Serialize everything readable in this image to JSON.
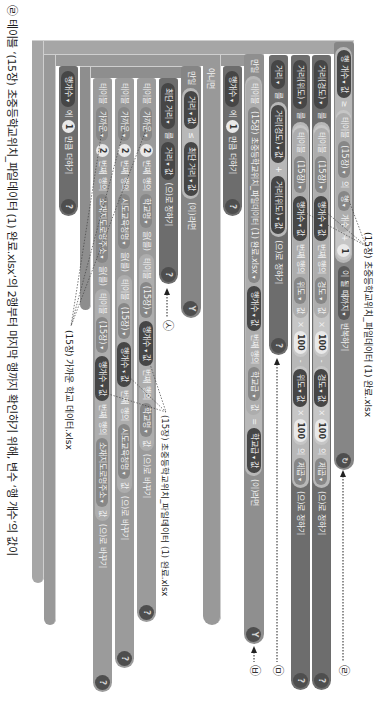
{
  "dropdown_arrow": "▾",
  "icons": {
    "loop": "↻",
    "branch": "Y",
    "help": "?"
  },
  "annotations": {
    "top_file": "(15장) 초중등학교위치_파일데이터 (1) 완료.xlsx",
    "mid_file": "(15장) 초중등학교위치_파일데이터 (1) 완료.xlsx",
    "near_file": "(15장) 가까운 학교 데이터.xlsx",
    "marks": {
      "r": "㉣",
      "m": "㉤",
      "b": "㉥",
      "s": "㉦"
    }
  },
  "blocks": {
    "loop": {
      "var": "행 개수",
      "val": "값",
      "op": "≥",
      "table_label": "테이블",
      "table": "(15장)",
      "of": "의",
      "row": "행",
      "count": "개수",
      "plus": "+",
      "one": "1",
      "until": "이 될 때까지",
      "repeat": "반복하기"
    },
    "set_lon": {
      "var": "거리(경도)",
      "to": "를",
      "table_label": "테이블",
      "table": "(15장)",
      "idx": "행개수",
      "idx_val": "값",
      "nth": "번째 행의",
      "field": "경도",
      "field_val": "값",
      "mul1": "×",
      "n1": "100",
      "minus": "-",
      "var2": "경도",
      "var2_val": "값",
      "mul2": "×",
      "n2": "100",
      "of": "의",
      "fn": "제곱",
      "set": "(으)로 정하기"
    },
    "set_lat": {
      "var": "거리(위도)",
      "to": "를",
      "table_label": "테이블",
      "table": "(15장)",
      "idx": "행개수",
      "idx_val": "값",
      "nth": "번째 행의",
      "field": "위도",
      "field_val": "값",
      "mul1": "×",
      "n1": "100",
      "minus": "-",
      "var2": "위도",
      "var2_val": "값",
      "mul2": "×",
      "n2": "100",
      "of": "의",
      "fn": "제곱",
      "set": "(으)로 정하기"
    },
    "set_dist": {
      "var": "거리",
      "to": "를",
      "a": "거리(경도)",
      "a_val": "값",
      "plus": "+",
      "b": "거리(위도)",
      "b_val": "값",
      "set": "(으)로 정하기"
    },
    "if_outer": {
      "kw": "만일",
      "table_label": "테이블",
      "table": "(15장) 초중등학교위치_파일데이터 (1) 완료.xlsx",
      "idx": "행개수",
      "idx_val": "값",
      "nth": "번째 행의",
      "field": "학교급",
      "field_val": "값",
      "eq": "=",
      "var": "학교급",
      "var_val": "값",
      "then": "(이)라면",
      "else": "아니면"
    },
    "add_row_1": {
      "var": "행개수",
      "to": "에",
      "n": "1",
      "add": "만큼 더하기"
    },
    "if_inner": {
      "kw": "만일",
      "a": "거리",
      "a_val": "값",
      "op": "≤",
      "b": "최단 거리",
      "b_val": "값",
      "then": "(이)라면"
    },
    "set_min": {
      "var": "최단 거리",
      "to": "를",
      "a": "거리",
      "a_val": "값",
      "set": "(으)로 정하기"
    },
    "replace_rows": [
      {
        "table_label": "테이블",
        "table": "가까운",
        "n": "2",
        "nth": "번째 행의",
        "field": "학교명",
        "obj": "을(를)",
        "src_label": "테이블",
        "src": "(15장)",
        "idx": "행개수",
        "idx_val": "값",
        "nth2": "번째 행의",
        "field2": "학교명",
        "field2_val": "값",
        "replace": "(으)로 바꾸기"
      },
      {
        "table_label": "테이블",
        "table": "가까운",
        "n": "2",
        "nth": "번째 행의",
        "field": "시도교육청명",
        "obj": "을(를)",
        "src_label": "테이블",
        "src": "(15장)",
        "idx": "행개수",
        "idx_val": "값",
        "nth2": "번째 행의",
        "field2": "시도교육청명",
        "field2_val": "값",
        "replace": "(으)로 바꾸기"
      },
      {
        "table_label": "테이블",
        "table": "가까운",
        "n": "2",
        "nth": "번째 행의",
        "field": "소재지도로명주소",
        "obj": "을(를)",
        "src_label": "테이블",
        "src": "(15장)",
        "idx": "행개수",
        "idx_val": "값",
        "nth2": "번째 행의",
        "field2": "소재지도로명주소",
        "field2_val": "값",
        "replace": "(으)로 바꾸기"
      }
    ],
    "add_row_2": {
      "var": "행개수",
      "to": "에",
      "n": "1",
      "add": "만큼 더하기"
    }
  },
  "caption": {
    "mark": "㉣",
    "text": "테이블 ‘(15장) 초중등학교위치_파일데이터 (1) 완료.xlsx’의 2행부터 마지막 행까지 확인하기 위해, 변수 ‘행 개수’의 값이"
  }
}
